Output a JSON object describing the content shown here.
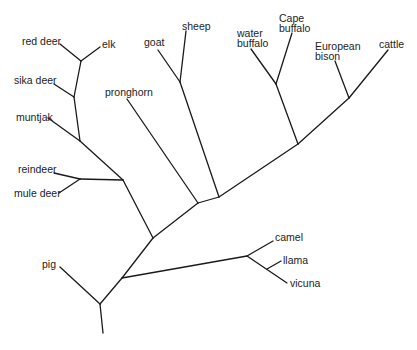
{
  "diagram": {
    "type": "phylogenetic-tree",
    "labels": {
      "red_deer": "red deer",
      "elk": "elk",
      "sika_deer": "sika deer",
      "muntjak": "muntjak",
      "reindeer": "reindeer",
      "mule_deer": "mule deer",
      "pig": "pig",
      "pronghorn": "pronghorn",
      "goat": "goat",
      "sheep": "sheep",
      "water_buffalo_1": "water",
      "water_buffalo_2": "buffalo",
      "cape_buffalo_1": "Cape",
      "cape_buffalo_2": "buffalo",
      "european_bison_1": "European",
      "european_bison_2": "bison",
      "cattle": "cattle",
      "camel": "camel",
      "llama": "llama",
      "vicuna": "vicuna"
    },
    "taxa": [
      "red deer",
      "elk",
      "sika deer",
      "muntjak",
      "reindeer",
      "mule deer",
      "pig",
      "pronghorn",
      "goat",
      "sheep",
      "water buffalo",
      "Cape buffalo",
      "European bison",
      "cattle",
      "camel",
      "llama",
      "vicuna"
    ]
  }
}
